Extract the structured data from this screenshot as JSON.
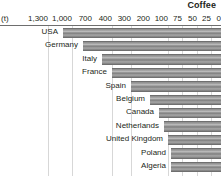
{
  "chart_data": {
    "type": "bar",
    "orientation": "horizontal",
    "title": "Coffee",
    "unit_label": "(t)",
    "xlabel": "",
    "ylabel": "",
    "grid": true,
    "axis_reversed": true,
    "axis_scale": "non-linear",
    "tick_labels": [
      "1,300",
      "1,000",
      "700",
      "400",
      "300",
      "200",
      "100",
      "75",
      "50",
      "25",
      "0"
    ],
    "tick_values": [
      1300,
      1000,
      700,
      400,
      300,
      200,
      100,
      75,
      50,
      25,
      0
    ],
    "categories": [
      "USA",
      "Germany",
      "Italy",
      "France",
      "Spain",
      "Belgium",
      "Canada",
      "Netherlands",
      "United Kingdom",
      "Poland",
      "Algeria"
    ],
    "values": [
      1300,
      1000,
      700,
      400,
      300,
      200,
      100,
      75,
      50,
      25,
      25
    ],
    "legend_position": "top-right",
    "colors": {
      "bar": "#9a9a9a",
      "bar_edge": "#6f6f6f",
      "gridline": "#d7d7d7",
      "axis_rule": "#6e6e6e",
      "text": "#231f20",
      "background": "#ffffff"
    }
  },
  "axis": {
    "unit": "(t)",
    "ticks": [
      {
        "label": "1,300",
        "x": 48
      },
      {
        "label": "1,000",
        "x": 72
      },
      {
        "label": "700",
        "x": 92
      },
      {
        "label": "400",
        "x": 112
      },
      {
        "label": "300",
        "x": 131
      },
      {
        "label": "200",
        "x": 150
      },
      {
        "label": "100",
        "x": 168
      },
      {
        "label": "75",
        "x": 182
      },
      {
        "label": "50",
        "x": 197
      },
      {
        "label": "25",
        "x": 211
      },
      {
        "label": "0",
        "x": 221
      }
    ]
  },
  "legend": {
    "series_name": "Coffee"
  },
  "rows": [
    {
      "label": "USA",
      "bar_start": 63,
      "label_x": 58
    },
    {
      "label": "Germany",
      "bar_start": 83,
      "label_x": 78
    },
    {
      "label": "Italy",
      "bar_start": 102,
      "label_x": 97
    },
    {
      "label": "France",
      "bar_start": 112,
      "label_x": 107
    },
    {
      "label": "Spain",
      "bar_start": 131,
      "label_x": 126
    },
    {
      "label": "Belgium",
      "bar_start": 150,
      "label_x": 145
    },
    {
      "label": "Canada",
      "bar_start": 159,
      "label_x": 154
    },
    {
      "label": "Netherlands",
      "bar_start": 164,
      "label_x": 159
    },
    {
      "label": "United Kingdom",
      "bar_start": 168,
      "label_x": 163
    },
    {
      "label": "Poland",
      "bar_start": 171,
      "label_x": 166
    },
    {
      "label": "Algeria",
      "bar_start": 171,
      "label_x": 166
    }
  ],
  "gridlines": [
    {
      "x": 48,
      "major": false
    },
    {
      "x": 72,
      "major": false
    },
    {
      "x": 92,
      "major": true
    },
    {
      "x": 112,
      "major": false
    },
    {
      "x": 131,
      "major": false
    },
    {
      "x": 150,
      "major": true
    },
    {
      "x": 168,
      "major": false
    },
    {
      "x": 182,
      "major": false
    },
    {
      "x": 197,
      "major": false
    },
    {
      "x": 211,
      "major": false
    }
  ]
}
